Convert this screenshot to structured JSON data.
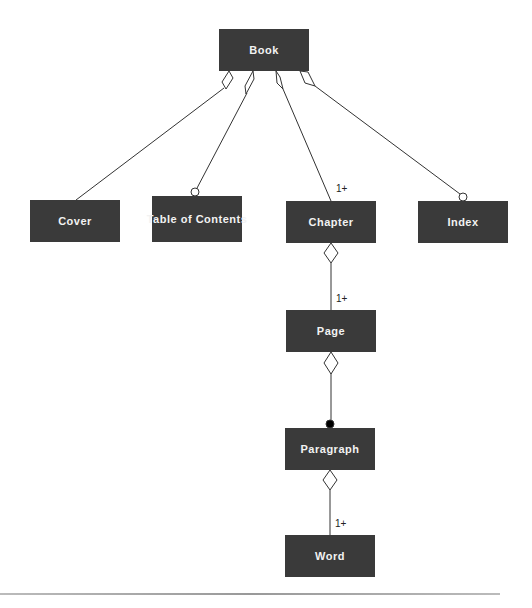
{
  "diagram": {
    "type": "UML class aggregation diagram",
    "nodes": [
      {
        "id": "book",
        "label": "Book"
      },
      {
        "id": "cover",
        "label": "Cover"
      },
      {
        "id": "toc",
        "label": "Table of Contents"
      },
      {
        "id": "chapter",
        "label": "Chapter"
      },
      {
        "id": "index",
        "label": "Index"
      },
      {
        "id": "page",
        "label": "Page"
      },
      {
        "id": "paragraph",
        "label": "Paragraph"
      },
      {
        "id": "word",
        "label": "Word"
      }
    ],
    "edges": [
      {
        "from": "book",
        "to": "cover",
        "source_end": "hollow-diamond",
        "target_end": "none",
        "multiplicity": ""
      },
      {
        "from": "book",
        "to": "toc",
        "source_end": "hollow-diamond",
        "target_end": "hollow-circle",
        "multiplicity": ""
      },
      {
        "from": "book",
        "to": "chapter",
        "source_end": "hollow-diamond",
        "target_end": "none",
        "multiplicity": "1+"
      },
      {
        "from": "book",
        "to": "index",
        "source_end": "hollow-diamond",
        "target_end": "hollow-circle",
        "multiplicity": ""
      },
      {
        "from": "chapter",
        "to": "page",
        "source_end": "hollow-diamond",
        "target_end": "none",
        "multiplicity": "1+"
      },
      {
        "from": "page",
        "to": "paragraph",
        "source_end": "hollow-diamond",
        "target_end": "filled-circle",
        "multiplicity": ""
      },
      {
        "from": "paragraph",
        "to": "word",
        "source_end": "hollow-diamond",
        "target_end": "none",
        "multiplicity": "1+"
      }
    ],
    "multiplicity_labels": {
      "chapter": "1+",
      "page": "1+",
      "word": "1+"
    }
  }
}
